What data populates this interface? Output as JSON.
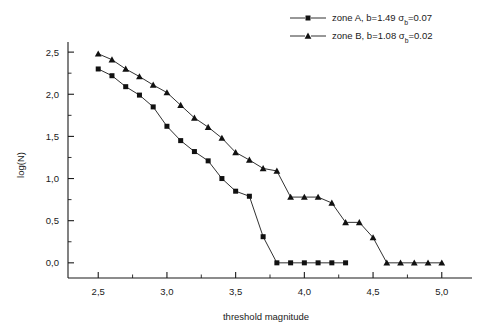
{
  "chart_data": {
    "type": "line",
    "title": "",
    "xlabel": "threshold magnitude",
    "ylabel": "log(N)",
    "xlim": [
      2.28,
      5.22
    ],
    "ylim": [
      -0.18,
      2.62
    ],
    "grid": false,
    "legend_position": "top-right",
    "x_ticks": [
      "2,5",
      "3,0",
      "3,5",
      "4,0",
      "4,5",
      "5,0"
    ],
    "x_tick_values": [
      2.5,
      3.0,
      3.5,
      4.0,
      4.5,
      5.0
    ],
    "x_minor_tick_values": [
      2.75,
      3.25,
      3.75,
      4.25,
      4.75
    ],
    "y_ticks": [
      "0,0",
      "0,5",
      "1,0",
      "1,5",
      "2,0",
      "2,5"
    ],
    "y_tick_values": [
      0.0,
      0.5,
      1.0,
      1.5,
      2.0,
      2.5
    ],
    "y_minor_tick_values": [
      0.25,
      0.75,
      1.25,
      1.75,
      2.25
    ],
    "marker_shapes": [
      "square",
      "triangle"
    ],
    "series": [
      {
        "name": "zone A, b=1.49 σb=0.07",
        "label_main": "zone A, b=1.49 σ",
        "label_sub": "b",
        "label_tail": "=0.07",
        "marker": "square",
        "color": "#111111",
        "x": [
          2.5,
          2.6,
          2.7,
          2.8,
          2.9,
          3.0,
          3.1,
          3.2,
          3.3,
          3.4,
          3.5,
          3.6,
          3.7,
          3.8,
          3.9,
          4.0,
          4.1,
          4.2,
          4.3
        ],
        "y": [
          2.3,
          2.22,
          2.09,
          1.99,
          1.85,
          1.62,
          1.45,
          1.32,
          1.21,
          1.0,
          0.85,
          0.79,
          0.31,
          0.0,
          0.0,
          0.0,
          0.0,
          0.0,
          0.0
        ]
      },
      {
        "name": "zone B, b=1.08 σb=0.02",
        "label_main": "zone B, b=1.08 σ",
        "label_sub": "b",
        "label_tail": "=0.02",
        "marker": "triangle",
        "color": "#111111",
        "x": [
          2.5,
          2.6,
          2.7,
          2.8,
          2.9,
          3.0,
          3.1,
          3.2,
          3.3,
          3.4,
          3.5,
          3.6,
          3.7,
          3.8,
          3.9,
          4.0,
          4.1,
          4.2,
          4.3,
          4.4,
          4.5,
          4.6,
          4.7,
          4.8,
          4.9,
          5.0
        ],
        "y": [
          2.48,
          2.41,
          2.3,
          2.21,
          2.11,
          2.02,
          1.87,
          1.72,
          1.61,
          1.48,
          1.31,
          1.22,
          1.12,
          1.09,
          0.78,
          0.78,
          0.78,
          0.71,
          0.48,
          0.48,
          0.3,
          0.0,
          0.0,
          0.0,
          0.0,
          0.0
        ]
      }
    ]
  },
  "axes": {
    "x_title": "threshold magnitude",
    "y_title": "log(N)"
  },
  "legend": {
    "entries": [
      {
        "main": "zone A, b=1.49 σ",
        "sub": "b",
        "tail": "=0.07"
      },
      {
        "main": "zone B, b=1.08 σ",
        "sub": "b",
        "tail": "=0.02"
      }
    ]
  }
}
